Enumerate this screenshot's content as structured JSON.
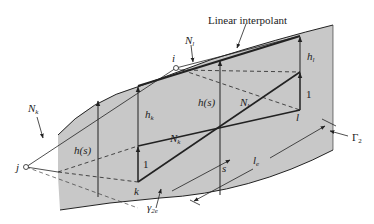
{
  "diagram": {
    "title_label": "Linear interpolant",
    "nodes": {
      "i": "i",
      "j": "j",
      "k": "k",
      "l": "l"
    },
    "shape_function_labels": {
      "N_l_top": "N",
      "N_l_top_sub": "l",
      "N_k_left": "N",
      "N_k_left_sub": "k",
      "N_k_mid": "N",
      "N_k_mid_sub": "k",
      "N_l_mid": "N",
      "N_l_mid_sub": "l"
    },
    "height_labels": {
      "h_k": "h",
      "h_k_sub": "k",
      "h_l": "h",
      "h_l_sub": "l",
      "h_s_mid": "h(s)",
      "h_s_left": "h(s)"
    },
    "unit_labels": {
      "one_k": "1",
      "one_l": "1"
    },
    "boundary_labels": {
      "gamma2": "Γ",
      "gamma2_sub": "2",
      "gamma2e": "γ",
      "gamma2e_sub": "2e"
    },
    "dimension_labels": {
      "s": "s",
      "le": "l",
      "le_sub": "e"
    },
    "colors": {
      "fill": "#c8c8c8",
      "stroke": "#222222",
      "background": "#ffffff"
    }
  }
}
